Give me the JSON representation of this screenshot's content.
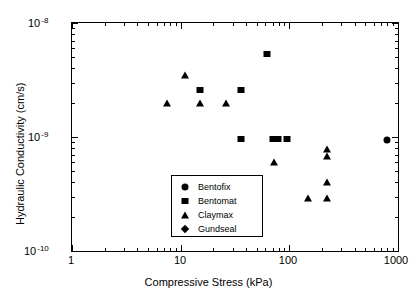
{
  "chart_data": {
    "type": "scatter",
    "title": "",
    "xlabel": "Compressive Stress (kPa)",
    "ylabel": "Hydraulic Conductivity (cm/s)",
    "xscale": "log",
    "yscale": "log",
    "xlim": [
      1,
      1000
    ],
    "ylim": [
      1e-10,
      1e-08
    ],
    "grid": false,
    "legend_position": "center-left-inside",
    "xticks": [
      {
        "value": 1,
        "label": "1"
      },
      {
        "value": 10,
        "label": "10"
      },
      {
        "value": 100,
        "label": "100"
      },
      {
        "value": 1000,
        "label": "1000"
      }
    ],
    "yticks": [
      {
        "value": 1e-08,
        "mantissa": "10",
        "exponent": "-8"
      },
      {
        "value": 1e-09,
        "mantissa": "10",
        "exponent": "-9"
      },
      {
        "value": 1e-10,
        "mantissa": "10",
        "exponent": "-10"
      }
    ],
    "series": [
      {
        "name": "Bentofix",
        "marker": "circle",
        "color": "#000000",
        "points": [
          {
            "x": 800,
            "y": 9.5e-10
          }
        ]
      },
      {
        "name": "Bentomat",
        "marker": "square",
        "color": "#000000",
        "points": [
          {
            "x": 15,
            "y": 2.6e-09
          },
          {
            "x": 36,
            "y": 2.6e-09
          },
          {
            "x": 62,
            "y": 5.3e-09
          },
          {
            "x": 36,
            "y": 9.6e-10
          },
          {
            "x": 70,
            "y": 9.6e-10
          },
          {
            "x": 78,
            "y": 9.6e-10
          },
          {
            "x": 95,
            "y": 9.6e-10
          }
        ]
      },
      {
        "name": "Claymax",
        "marker": "triangle",
        "color": "#000000",
        "points": [
          {
            "x": 11,
            "y": 3.5e-09
          },
          {
            "x": 7.5,
            "y": 2e-09
          },
          {
            "x": 15,
            "y": 2e-09
          },
          {
            "x": 26,
            "y": 2e-09
          },
          {
            "x": 72,
            "y": 6e-10
          },
          {
            "x": 220,
            "y": 7.8e-10
          },
          {
            "x": 220,
            "y": 6.8e-10
          },
          {
            "x": 220,
            "y": 4e-10
          },
          {
            "x": 220,
            "y": 2.9e-10
          },
          {
            "x": 150,
            "y": 2.9e-10
          }
        ]
      },
      {
        "name": "Gundseal",
        "marker": "diamond",
        "color": "#000000",
        "points": []
      }
    ]
  },
  "legend": {
    "entries": [
      {
        "label": "Bentofix",
        "marker": "circle"
      },
      {
        "label": "Bentomat",
        "marker": "square"
      },
      {
        "label": "Claymax",
        "marker": "triangle"
      },
      {
        "label": "Gundseal",
        "marker": "diamond"
      }
    ]
  }
}
